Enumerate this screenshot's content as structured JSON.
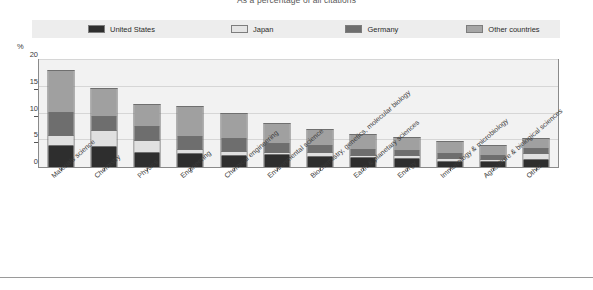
{
  "chart_title": "As a percentage of all citations",
  "y_axis": {
    "unit_label": "%",
    "ticks": [
      "0",
      "5",
      "10",
      "15",
      "20"
    ],
    "min": 0,
    "max": 20
  },
  "legend": {
    "items": [
      {
        "label": "United States",
        "color": "#2e2e2e",
        "icon": "legend-swatch-icon"
      },
      {
        "label": "Japan",
        "color": "#e0e0e0",
        "icon": "legend-swatch-icon"
      },
      {
        "label": "Germany",
        "color": "#6e6e6e",
        "icon": "legend-swatch-icon"
      },
      {
        "label": "Other countries",
        "color": "#a0a0a0",
        "icon": "legend-swatch-icon"
      }
    ]
  },
  "chart_data": {
    "type": "bar",
    "stacked": true,
    "title": "As a percentage of all citations",
    "xlabel": "",
    "ylabel": "%",
    "ylim": [
      0,
      20
    ],
    "yticks": [
      0,
      5,
      10,
      15,
      20
    ],
    "grid": true,
    "legend_position": "top",
    "categories": [
      "Materials science",
      "Chemistry",
      "Physics",
      "Engineering",
      "Chemical engineering",
      "Environmental science",
      "Biochemistry, genetics, molecular biology",
      "Earth & planetary sciences",
      "Energy",
      "Immunology & microbiology",
      "Agriculture & biological sciences",
      "Other"
    ],
    "series": [
      {
        "name": "United States",
        "color": "#2e2e2e",
        "values": [
          4.0,
          3.7,
          2.6,
          2.4,
          2.1,
          2.2,
          1.9,
          1.6,
          1.5,
          1.0,
          0.9,
          1.4
        ]
      },
      {
        "name": "Japan",
        "color": "#e0e0e0",
        "values": [
          1.7,
          2.8,
          2.0,
          0.6,
          0.6,
          0.3,
          0.5,
          0.3,
          0.3,
          0.3,
          0.2,
          0.8
        ]
      },
      {
        "name": "Germany",
        "color": "#6e6e6e",
        "values": [
          4.1,
          2.4,
          2.6,
          2.2,
          2.1,
          1.4,
          1.2,
          1.0,
          0.9,
          0.7,
          0.6,
          0.8
        ]
      },
      {
        "name": "Other countries",
        "color": "#a0a0a0",
        "values": [
          7.5,
          5.1,
          3.8,
          5.5,
          4.6,
          3.5,
          2.7,
          2.6,
          2.1,
          2.1,
          1.7,
          1.7
        ]
      }
    ],
    "totals": [
      17.3,
      14.0,
      11.0,
      10.7,
      9.4,
      7.4,
      6.3,
      5.5,
      4.8,
      4.1,
      3.4,
      4.7
    ]
  }
}
